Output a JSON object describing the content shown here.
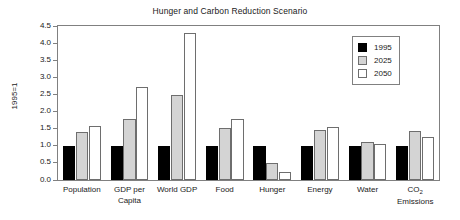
{
  "chart_data": {
    "type": "bar",
    "title": "Hunger and Carbon Reduction Scenario",
    "xlabel": "",
    "ylabel": "1995=1",
    "ylim": [
      0.0,
      4.5
    ],
    "ytick_labels": [
      "0.0",
      "0.5",
      "1.0",
      "1.5",
      "2.0",
      "2.5",
      "3.0",
      "3.5",
      "4.0",
      "4.5"
    ],
    "ytick_values": [
      0.0,
      0.5,
      1.0,
      1.5,
      2.0,
      2.5,
      3.0,
      3.5,
      4.0,
      4.5
    ],
    "grid": false,
    "legend_position": "top-right",
    "categories": [
      "Population",
      "GDP per Capita",
      "World GDP",
      "Food",
      "Hunger",
      "Energy",
      "Water",
      "CO2 Emissions"
    ],
    "category_labels_display": [
      "Population",
      "GDP per\nCapita",
      "World GDP",
      "Food",
      "Hunger",
      "Energy",
      "Water",
      "CO₂\nEmissions"
    ],
    "series": [
      {
        "name": "1995",
        "color": "#000000",
        "values": [
          1.0,
          1.0,
          1.0,
          1.0,
          1.0,
          1.0,
          1.0,
          1.0
        ]
      },
      {
        "name": "2025",
        "color": "#d4d4d4",
        "values": [
          1.4,
          1.79,
          2.48,
          1.52,
          0.5,
          1.45,
          1.1,
          1.42
        ]
      },
      {
        "name": "2050",
        "color": "#ffffff",
        "values": [
          1.58,
          2.71,
          4.29,
          1.78,
          0.24,
          1.56,
          1.05,
          1.25
        ]
      }
    ]
  },
  "legend": {
    "entries": [
      {
        "label": "1995"
      },
      {
        "label": "2025"
      },
      {
        "label": "2050"
      }
    ]
  }
}
